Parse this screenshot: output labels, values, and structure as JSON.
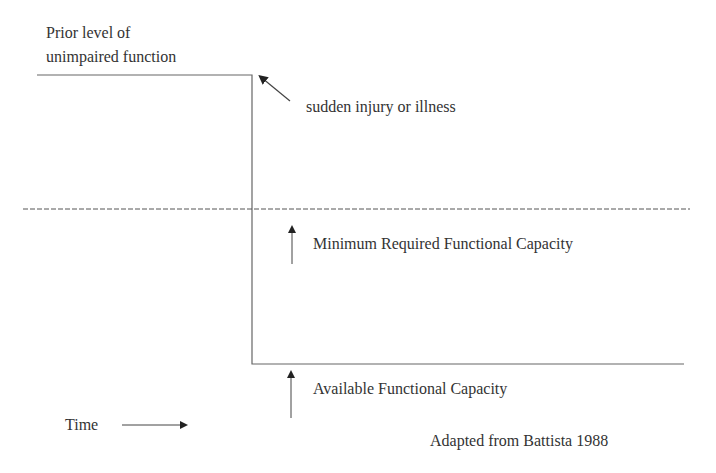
{
  "diagram": {
    "prior_level_line1": "Prior level of",
    "prior_level_line2": "unimpaired function",
    "event_label": "sudden injury or illness",
    "min_capacity_label": "Minimum Required Functional Capacity",
    "available_capacity_label": "Available Functional Capacity",
    "time_label": "Time",
    "source_label": "Adapted from Battista 1988",
    "colors": {
      "line": "#555555",
      "text": "#333333",
      "background": "#ffffff"
    }
  }
}
